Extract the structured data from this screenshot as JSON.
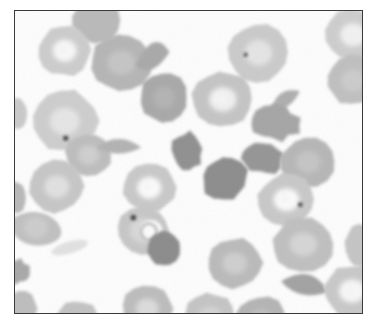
{
  "figure": {
    "kind": "micrograph",
    "specimen_label": "peripheral blood smear",
    "background_color": "#fdfdfd",
    "frame_border_color": "#3a3a3a",
    "frame": {
      "x": 14,
      "y": 10,
      "width": 349,
      "height": 304
    },
    "caption_text": "",
    "caption_color": "#d8d8d8"
  },
  "palette": {
    "cell_pale": "#d4d4d4",
    "cell_mid": "#c2c2c2",
    "cell_medium": "#b4b4b4",
    "cell_dark": "#9e9e9e",
    "cell_darkest": "#8d8d8d",
    "highlight": "#f6f6f6",
    "inclusion_dot": "#4a4a4a",
    "background": "#fdfdfd"
  },
  "cells": [
    {
      "id": "c01",
      "name": "erythrocyte",
      "shape": "disc",
      "cx": 82,
      "cy": 10,
      "rx": 24,
      "ry": 23,
      "fill": "#b9b9b9",
      "highlight": 0.0,
      "rot": 0
    },
    {
      "id": "c02",
      "name": "erythrocyte-central-pallor",
      "shape": "disc",
      "cx": 50,
      "cy": 40,
      "rx": 26,
      "ry": 25,
      "fill": "#cccccc",
      "highlight": 0.85,
      "rot": 0
    },
    {
      "id": "c03",
      "name": "erythrocyte",
      "shape": "disc",
      "cx": 107,
      "cy": 52,
      "rx": 30,
      "ry": 28,
      "fill": "#b5b5b5",
      "highlight": 0.25,
      "rot": 0
    },
    {
      "id": "c04",
      "name": "echinocyte-fragment",
      "shape": "wedge",
      "cx": 139,
      "cy": 43,
      "rx": 16,
      "ry": 26,
      "fill": "#a9a9a9",
      "highlight": 0.0,
      "rot": 8
    },
    {
      "id": "c05",
      "name": "erythrocyte",
      "shape": "disc",
      "cx": 245,
      "cy": 42,
      "rx": 30,
      "ry": 29,
      "fill": "#cacaca",
      "highlight": 0.5,
      "rot": 0
    },
    {
      "id": "c06",
      "name": "erythrocyte",
      "shape": "disc",
      "cx": 340,
      "cy": 24,
      "rx": 28,
      "ry": 26,
      "fill": "#cdcdcd",
      "highlight": 0.7,
      "rot": 0
    },
    {
      "id": "c07",
      "name": "erythrocyte",
      "shape": "disc",
      "cx": 340,
      "cy": 70,
      "rx": 26,
      "ry": 25,
      "fill": "#bfbfbf",
      "highlight": 0.15,
      "rot": 0
    },
    {
      "id": "c08",
      "name": "erythrocyte",
      "shape": "disc",
      "cx": 150,
      "cy": 87,
      "rx": 24,
      "ry": 25,
      "fill": "#a8a8a8",
      "highlight": 0.1,
      "rot": 0
    },
    {
      "id": "c09",
      "name": "erythrocyte-central-pallor",
      "shape": "disc",
      "cx": 209,
      "cy": 89,
      "rx": 30,
      "ry": 28,
      "fill": "#c4c4c4",
      "highlight": 0.85,
      "rot": 0
    },
    {
      "id": "c10",
      "name": "schistocyte",
      "shape": "wedge",
      "cx": 271,
      "cy": 88,
      "rx": 17,
      "ry": 14,
      "fill": "#aeaeae",
      "highlight": 0.0,
      "rot": -18
    },
    {
      "id": "c11",
      "name": "erythrocyte-partial-left",
      "shape": "disc",
      "cx": 2,
      "cy": 103,
      "rx": 10,
      "ry": 16,
      "fill": "#c9c9c9",
      "highlight": 0.0,
      "rot": 0
    },
    {
      "id": "c12",
      "name": "erythrocyte-with-inclusion",
      "shape": "disc",
      "cx": 50,
      "cy": 111,
      "rx": 33,
      "ry": 31,
      "fill": "#cdcdcd",
      "highlight": 0.45,
      "rot": 0
    },
    {
      "id": "c13",
      "name": "acanthocyte",
      "shape": "blob",
      "cx": 262,
      "cy": 113,
      "rx": 24,
      "ry": 17,
      "fill": "#a5a5a5",
      "highlight": 0.0,
      "rot": 6
    },
    {
      "id": "c14",
      "name": "erythrocyte",
      "shape": "disc",
      "cx": 74,
      "cy": 145,
      "rx": 23,
      "ry": 22,
      "fill": "#bdbdbd",
      "highlight": 0.3,
      "rot": 0
    },
    {
      "id": "c15",
      "name": "schistocyte",
      "shape": "wedge",
      "cx": 105,
      "cy": 135,
      "rx": 22,
      "ry": 14,
      "fill": "#b2b2b2",
      "highlight": 0.0,
      "rot": 12
    },
    {
      "id": "c16",
      "name": "dark-cell",
      "shape": "blob",
      "cx": 174,
      "cy": 141,
      "rx": 15,
      "ry": 19,
      "fill": "#8f8f8f",
      "highlight": 0.0,
      "rot": -8
    },
    {
      "id": "c17",
      "name": "acanthocyte-dark",
      "shape": "blob",
      "cx": 249,
      "cy": 148,
      "rx": 20,
      "ry": 16,
      "fill": "#959595",
      "highlight": 0.0,
      "rot": 10
    },
    {
      "id": "c18",
      "name": "erythrocyte",
      "shape": "disc",
      "cx": 295,
      "cy": 152,
      "rx": 27,
      "ry": 25,
      "fill": "#b6b6b6",
      "highlight": 0.2,
      "rot": 0
    },
    {
      "id": "c19",
      "name": "erythrocyte-partial-left",
      "shape": "disc",
      "cx": 1,
      "cy": 188,
      "rx": 10,
      "ry": 16,
      "fill": "#b8b8b8",
      "highlight": 0.0,
      "rot": 0
    },
    {
      "id": "c20",
      "name": "erythrocyte",
      "shape": "disc",
      "cx": 42,
      "cy": 177,
      "rx": 27,
      "ry": 26,
      "fill": "#c6c6c6",
      "highlight": 0.5,
      "rot": 0
    },
    {
      "id": "c21",
      "name": "erythrocyte-central-pallor",
      "shape": "disc",
      "cx": 135,
      "cy": 178,
      "rx": 26,
      "ry": 25,
      "fill": "#c8c8c8",
      "highlight": 1.0,
      "rot": 0
    },
    {
      "id": "c22",
      "name": "dark-cell",
      "shape": "blob",
      "cx": 212,
      "cy": 169,
      "rx": 23,
      "ry": 21,
      "fill": "#8c8c8c",
      "highlight": 0.0,
      "rot": 0
    },
    {
      "id": "c23",
      "name": "erythrocyte-with-inclusion",
      "shape": "disc",
      "cx": 273,
      "cy": 190,
      "rx": 28,
      "ry": 26,
      "fill": "#c8c8c8",
      "highlight": 1.0,
      "rot": 0
    },
    {
      "id": "c24",
      "name": "teardrop-cell",
      "shape": "teardrop",
      "cx": 21,
      "cy": 218,
      "rx": 26,
      "ry": 24,
      "fill": "#c0c0c0",
      "highlight": 0.15,
      "rot": 0
    },
    {
      "id": "c25",
      "name": "ring-form-cell",
      "shape": "ring",
      "cx": 129,
      "cy": 221,
      "rx": 26,
      "ry": 24,
      "fill": "#c6c6c6",
      "highlight": 0.3,
      "rot": 0
    },
    {
      "id": "c26",
      "name": "dark-cell",
      "shape": "disc",
      "cx": 150,
      "cy": 239,
      "rx": 17,
      "ry": 17,
      "fill": "#8b8b8b",
      "highlight": 0.0,
      "rot": 0
    },
    {
      "id": "c27",
      "name": "platelet-fragment",
      "shape": "sliver",
      "cx": 55,
      "cy": 238,
      "rx": 19,
      "ry": 6,
      "fill": "#dcdcdc",
      "highlight": 0.0,
      "rot": -16
    },
    {
      "id": "c28",
      "name": "erythrocyte",
      "shape": "disc",
      "cx": 290,
      "cy": 235,
      "rx": 30,
      "ry": 27,
      "fill": "#bfbfbf",
      "highlight": 0.4,
      "rot": 0
    },
    {
      "id": "c29",
      "name": "erythrocyte-partial-left",
      "shape": "blob",
      "cx": 2,
      "cy": 262,
      "rx": 12,
      "ry": 12,
      "fill": "#a8a8a8",
      "highlight": 0.0,
      "rot": 0
    },
    {
      "id": "c30",
      "name": "erythrocyte",
      "shape": "disc",
      "cx": 221,
      "cy": 254,
      "rx": 27,
      "ry": 25,
      "fill": "#bababa",
      "highlight": 0.35,
      "rot": 0
    },
    {
      "id": "c31",
      "name": "schistocyte",
      "shape": "wedge",
      "cx": 293,
      "cy": 274,
      "rx": 23,
      "ry": 20,
      "fill": "#a2a2a2",
      "highlight": 0.0,
      "rot": 30
    },
    {
      "id": "c32",
      "name": "erythrocyte-partial-right",
      "shape": "disc",
      "cx": 348,
      "cy": 237,
      "rx": 16,
      "ry": 22,
      "fill": "#c5c5c5",
      "highlight": 0.0,
      "rot": 0
    },
    {
      "id": "c33",
      "name": "erythrocyte-central-pallor",
      "shape": "disc",
      "cx": 339,
      "cy": 282,
      "rx": 28,
      "ry": 26,
      "fill": "#c8c8c8",
      "highlight": 0.9,
      "rot": 0
    },
    {
      "id": "c34",
      "name": "erythrocyte-partial-bottom",
      "shape": "disc",
      "cx": 133,
      "cy": 300,
      "rx": 25,
      "ry": 24,
      "fill": "#bcbcbc",
      "highlight": 0.6,
      "rot": 0
    },
    {
      "id": "c35",
      "name": "erythrocyte-partial-bottom",
      "shape": "disc",
      "cx": 196,
      "cy": 308,
      "rx": 26,
      "ry": 24,
      "fill": "#c4c4c4",
      "highlight": 0.25,
      "rot": 0
    },
    {
      "id": "c36",
      "name": "erythrocyte-partial-bottom",
      "shape": "disc",
      "cx": 248,
      "cy": 310,
      "rx": 25,
      "ry": 23,
      "fill": "#b4b4b4",
      "highlight": 0.15,
      "rot": 0
    },
    {
      "id": "c37",
      "name": "erythrocyte-partial-bottom",
      "shape": "disc",
      "cx": 63,
      "cy": 312,
      "rx": 22,
      "ry": 20,
      "fill": "#c2c2c2",
      "highlight": 0.0,
      "rot": 0
    },
    {
      "id": "c38",
      "name": "erythrocyte-partial-bottom-left",
      "shape": "disc",
      "cx": 6,
      "cy": 300,
      "rx": 16,
      "ry": 18,
      "fill": "#bdbdbd",
      "highlight": 0.0,
      "rot": 0
    }
  ],
  "inclusions": [
    {
      "id": "i1",
      "name": "parasite-dot",
      "cx": 51,
      "cy": 128,
      "r": 2.6,
      "fill": "#4a4a4a"
    },
    {
      "id": "i2",
      "name": "parasite-dot",
      "cx": 232,
      "cy": 44,
      "r": 2.2,
      "fill": "#5a5a5a"
    },
    {
      "id": "i3",
      "name": "parasite-dot",
      "cx": 287,
      "cy": 195,
      "r": 2.4,
      "fill": "#4f4f4f"
    },
    {
      "id": "i4",
      "name": "parasite-dot",
      "cx": 119,
      "cy": 208,
      "r": 2.8,
      "fill": "#454545"
    }
  ],
  "annotations": {
    "scale_bar_present": false,
    "labels": []
  }
}
